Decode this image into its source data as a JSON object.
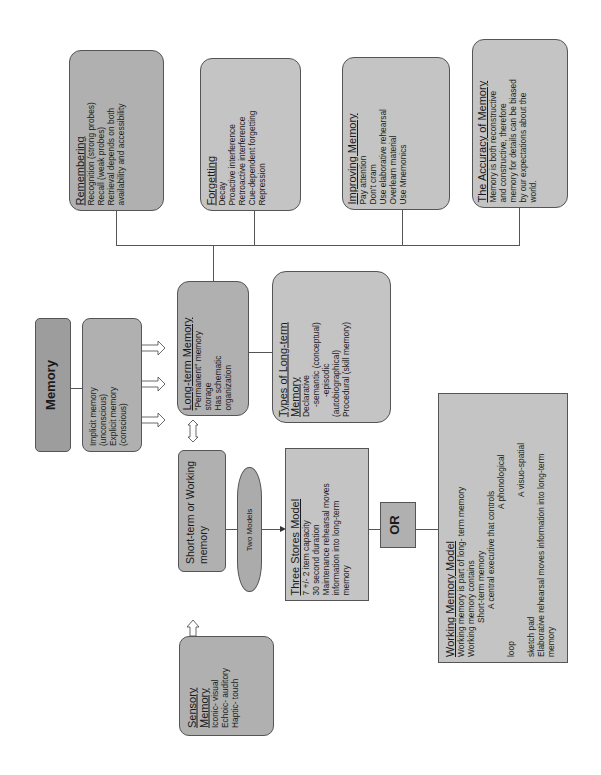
{
  "diagram": {
    "root": {
      "title": "Memory"
    },
    "types": {
      "lines": [
        "Implicit memory",
        "(unconscious)",
        "Explicit memory",
        "(conscious)"
      ]
    },
    "long_term": {
      "title": "Long-term Memory",
      "lines": [
        "\"Permanent\" memory",
        "storage",
        "Has schematic",
        "organization"
      ]
    },
    "types_long_term": {
      "title": "Types of Long-term",
      "title2": "Memory",
      "lines": [
        "Declarative",
        "-semantic (conceptual)",
        "-episodic",
        "(autobiographical)",
        "Procedural (skill memory)"
      ]
    },
    "remembering": {
      "title": "Remembering",
      "lines": [
        "Recognition (strong probes)",
        "Recall (weak probes)",
        "Retrieval depends on both",
        "availability and accessibility"
      ]
    },
    "forgetting": {
      "title": "Forgetting",
      "lines": [
        "Decay",
        "Proactive interference",
        "Retroactive interference",
        "Cue-dependent forgetting",
        "Repression"
      ]
    },
    "improving": {
      "title": "Improving Memory",
      "lines": [
        "Pay attention",
        "Don't cram",
        "Use elaborative rehearsal",
        "Overlearn material",
        "Use Mnemonics"
      ]
    },
    "accuracy": {
      "title": "The Accuracy of Memory",
      "lines": [
        "Memory is both reconstructive",
        "and constructive, therefore",
        "memory for details can be biased",
        "by our expectations about the",
        "world."
      ]
    },
    "short_term": {
      "title_line1": "Short-term or Working",
      "title_line2": "memory"
    },
    "two_models": {
      "label": "Two Models"
    },
    "three_stores": {
      "title": "Three Stores Model",
      "lines": [
        "7 +/- 2 item capacity",
        "30 second duration",
        "Maintenance rehearsal moves",
        "information into long-term",
        "memory"
      ]
    },
    "or_box": {
      "label": "OR"
    },
    "working_model": {
      "title": "Working Memory Model",
      "lines": [
        "Working memory is part of long- term memory",
        "Working memory contains"
      ],
      "indent_lines": [
        "Short-term memory",
        "A central executive that controls"
      ],
      "indent2_lines": [
        "A phonological"
      ],
      "loop": "loop",
      "visuo": "A visuo-spatial",
      "sketch": "sketch pad",
      "tail_lines": [
        "Elaborative rehearsal moves information into long-term",
        "memory"
      ]
    },
    "sensory": {
      "title1": "Sensory",
      "title2": "Memory",
      "lines": [
        "Iconic- visual",
        "Echoic- auditory",
        "Haptic- touch"
      ]
    }
  },
  "colors": {
    "box_fill": "#bdbdbd",
    "dark_fill": "#9d9d9d",
    "border": "#555555",
    "background": "#ffffff"
  }
}
